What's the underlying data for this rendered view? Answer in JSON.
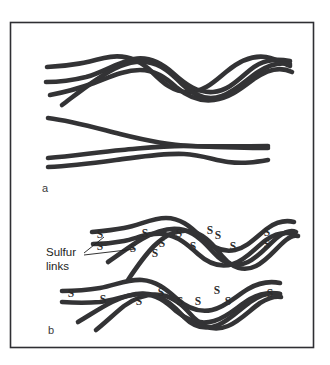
{
  "figure": {
    "background_color": "#ffffff",
    "frame": {
      "stroke_color": "#2f2f33",
      "x": 10,
      "y": 22,
      "width": 303,
      "height": 325
    },
    "chain_color": "#333335",
    "panels": [
      {
        "id": "a",
        "label": "a",
        "label_x": 42,
        "label_y": 192,
        "description": "unvulcanized entangled polymer chains"
      },
      {
        "id": "b",
        "label": "b",
        "label_x": 48,
        "label_y": 334,
        "description": "vulcanized polymer chains with sulfur cross-links"
      }
    ],
    "annotation": {
      "line1": "Sulfur",
      "line2": "links",
      "line1_x": 46,
      "line1_y": 256,
      "line2_x": 46,
      "line2_y": 270,
      "leader_lines": [
        {
          "x1": 84,
          "y1": 253,
          "x2": 104,
          "y2": 237
        },
        {
          "x1": 84,
          "y1": 255,
          "x2": 135,
          "y2": 249
        }
      ]
    },
    "sulfur_symbol": "S",
    "sulfur_marks_upper": [
      {
        "x": 100,
        "y": 238
      },
      {
        "x": 100,
        "y": 250
      },
      {
        "x": 133,
        "y": 252
      },
      {
        "x": 145,
        "y": 237
      },
      {
        "x": 155,
        "y": 257
      },
      {
        "x": 162,
        "y": 247
      },
      {
        "x": 179,
        "y": 237
      },
      {
        "x": 193,
        "y": 250
      },
      {
        "x": 210,
        "y": 234
      },
      {
        "x": 218,
        "y": 239
      },
      {
        "x": 233,
        "y": 250
      },
      {
        "x": 267,
        "y": 236
      },
      {
        "x": 267,
        "y": 248
      }
    ],
    "sulfur_marks_lower": [
      {
        "x": 71,
        "y": 297
      },
      {
        "x": 103,
        "y": 303
      },
      {
        "x": 139,
        "y": 305
      },
      {
        "x": 161,
        "y": 296
      },
      {
        "x": 180,
        "y": 305
      },
      {
        "x": 198,
        "y": 305
      },
      {
        "x": 217,
        "y": 294
      },
      {
        "x": 228,
        "y": 305
      },
      {
        "x": 270,
        "y": 297
      }
    ]
  }
}
